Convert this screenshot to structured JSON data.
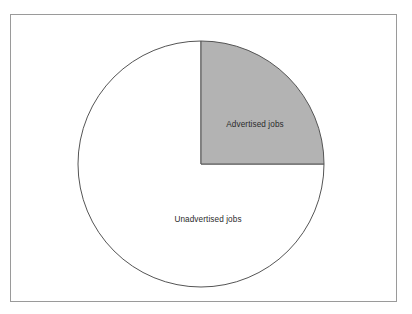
{
  "chart_data": {
    "type": "pie",
    "title": "",
    "subtitle": "",
    "xlabel": "",
    "ylabel": "",
    "legend_position": "none",
    "grid": false,
    "categories": [
      "Advertised jobs",
      "Unadvertised jobs"
    ],
    "values": [
      25,
      75
    ],
    "units": "percent",
    "slices": [
      {
        "label": "Advertised jobs",
        "value": 25,
        "fraction": 0.25,
        "start_angle_deg": 0,
        "end_angle_deg": 90,
        "fill": "#b3b3b3",
        "stroke": "#555555"
      },
      {
        "label": "Unadvertised jobs",
        "value": 75,
        "fraction": 0.75,
        "start_angle_deg": 90,
        "end_angle_deg": 360,
        "fill": "#ffffff",
        "stroke": "#555555"
      }
    ],
    "annotations": [
      {
        "text": "Advertised jobs",
        "x": 255,
        "y": 125
      },
      {
        "text": "Unadvertised jobs",
        "x": 208,
        "y": 220
      }
    ]
  },
  "figure": {
    "frame_color": "#9a9a9a",
    "background_color": "#ffffff",
    "outline_color": "#555555",
    "shaded_color": "#b3b3b3",
    "text_color": "#2b2b2b"
  },
  "labels": {
    "advertised": "Advertised jobs",
    "unadvertised": "Unadvertised jobs"
  }
}
